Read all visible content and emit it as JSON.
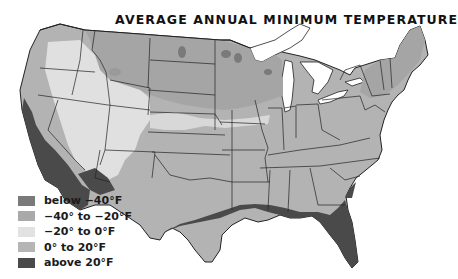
{
  "map": {
    "title": "AVERAGE ANNUAL MINIMUM TEMPERATURE",
    "region": "Contiguous United States",
    "colors": {
      "below_-40": "#7a7a7a",
      "-40_to_-20": "#a9a9a9",
      "-20_to_0": "#dcdcdc",
      "0_to_20": "#b8b8b8",
      "above_20": "#4a4a4a",
      "state_border": "#222222",
      "water": "#ffffff"
    }
  },
  "legend": {
    "items": [
      {
        "label": "below −40°F",
        "color": "#7a7a7a"
      },
      {
        "label": "−40° to −20°F",
        "color": "#a9a9a9"
      },
      {
        "label": "−20° to 0°F",
        "color": "#e2e2e2"
      },
      {
        "label": "0° to 20°F",
        "color": "#b5b5b5"
      },
      {
        "label": "above 20°F",
        "color": "#4a4a4a"
      }
    ]
  }
}
